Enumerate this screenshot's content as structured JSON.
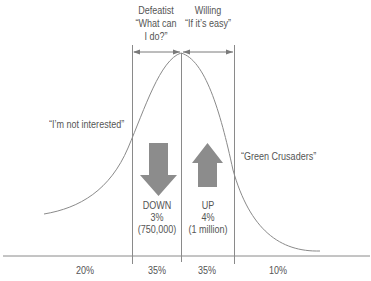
{
  "header": {
    "defeatist": {
      "title": "Defeatist",
      "quote_line1": "“What can",
      "quote_line2": "I do?”"
    },
    "willing": {
      "title": "Willing",
      "quote": "“If it’s easy”"
    }
  },
  "side_labels": {
    "left": "“I’m not interested”",
    "right": "“Green Crusaders”"
  },
  "arrows": {
    "down": {
      "icon": "down-arrow-icon",
      "label": "DOWN",
      "percent": "3%",
      "count": "(750,000)"
    },
    "up": {
      "icon": "up-arrow-icon",
      "label": "UP",
      "percent": "4%",
      "count": "(1 million)"
    }
  },
  "segments": [
    {
      "percent": "20%"
    },
    {
      "percent": "35%"
    },
    {
      "percent": "35%"
    },
    {
      "percent": "10%"
    }
  ],
  "colors": {
    "line": "#8a8a8a",
    "arrow_fill": "#8c8c8c",
    "text": "#555555"
  }
}
